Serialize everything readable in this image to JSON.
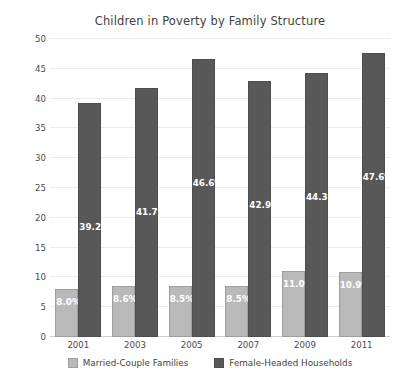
{
  "chart_data": {
    "type": "bar",
    "title": "Children in Poverty by Family Structure",
    "xlabel": "",
    "ylabel": "",
    "ylim": [
      0,
      50
    ],
    "yticks": [
      0,
      5,
      10,
      15,
      20,
      25,
      30,
      35,
      40,
      45,
      50
    ],
    "ytick_labels": [
      "0",
      "5",
      "10",
      "15",
      "20",
      "25",
      "30",
      "35",
      "40",
      "45",
      "50"
    ],
    "grid": true,
    "legend_position": "bottom-center",
    "categories": [
      "2001",
      "2003",
      "2005",
      "2007",
      "2009",
      "2011"
    ],
    "series": [
      {
        "name": "Married-Couple Families",
        "color": "#b9b9b9",
        "values": [
          8.0,
          8.6,
          8.5,
          8.5,
          11.0,
          10.9
        ],
        "labels": [
          "8.0%",
          "8.6%",
          "8.5%",
          "8.5%",
          "11.0%",
          "10.9%"
        ]
      },
      {
        "name": "Female-Headed Households",
        "color": "#585858",
        "values": [
          39.2,
          41.7,
          46.6,
          42.9,
          44.3,
          47.6
        ],
        "labels": [
          "39.2%",
          "41.7%",
          "46.6%",
          "42.9%",
          "44.3%",
          "47.6%"
        ]
      }
    ]
  }
}
